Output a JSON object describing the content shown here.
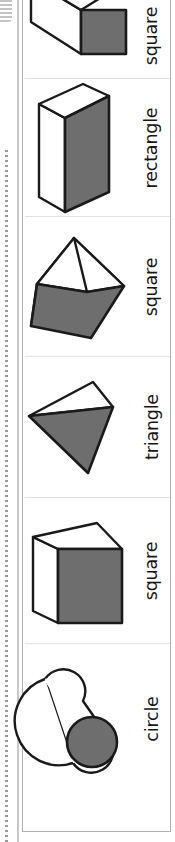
{
  "worksheet": {
    "orientation": "rotated-90",
    "binding": "spiral-notebook-edge",
    "colors": {
      "face_fill": "#6e6e6e",
      "face_light": "#ffffff",
      "outline": "#1a1a1a",
      "sheet_border": "#b0b0b0",
      "divider": "#dcdcdc",
      "page_background": "#ffffff"
    },
    "rows": [
      {
        "id": "row-1",
        "label": "square",
        "solid": "rectangular-prism-long",
        "solid_name": "long-square-prism-icon",
        "cross_section": "square",
        "clipped_top": true
      },
      {
        "id": "row-2",
        "label": "rectangle",
        "solid": "rectangular-prism",
        "solid_name": "rectangular-prism-icon",
        "cross_section": "rectangle",
        "clipped_top": false
      },
      {
        "id": "row-3",
        "label": "square",
        "solid": "square-pyramid",
        "solid_name": "square-pyramid-icon",
        "cross_section": "square",
        "clipped_top": false
      },
      {
        "id": "row-4",
        "label": "triangle",
        "solid": "triangular-pyramid",
        "solid_name": "tetrahedron-icon",
        "cross_section": "triangle",
        "clipped_top": false
      },
      {
        "id": "row-5",
        "label": "square",
        "solid": "cube",
        "solid_name": "cube-icon",
        "cross_section": "square",
        "clipped_top": false
      },
      {
        "id": "row-6",
        "label": "circle",
        "solid": "cylinder",
        "solid_name": "cylinder-icon",
        "cross_section": "circle",
        "clipped_top": false
      }
    ]
  }
}
